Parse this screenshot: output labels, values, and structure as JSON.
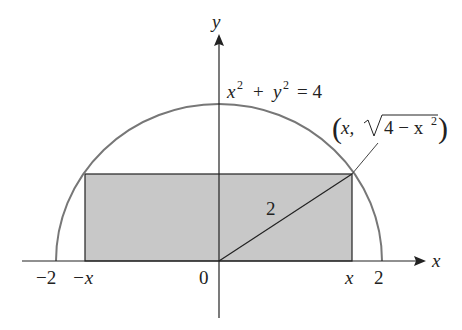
{
  "labels": {
    "y_axis": "y",
    "x_axis": "x",
    "neg_two": "−2",
    "neg_x": "−x",
    "origin": "0",
    "pos_x": "x",
    "pos_two": "2",
    "hyp": "2",
    "eq_x": "x",
    "eq_exp": "2",
    "eq_plus": "+",
    "eq_y": "y",
    "eq_rhs": "= 4",
    "pt_open": "(",
    "pt_x": "x,",
    "pt_radicand": "4 − x",
    "pt_exp": "2",
    "pt_close": ")"
  },
  "colors": {
    "shade": "#c8c8c8",
    "curve": "#777777",
    "line": "#222222"
  }
}
